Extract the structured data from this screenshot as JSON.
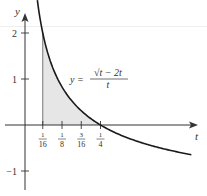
{
  "chart_data": {
    "type": "line",
    "title": "",
    "xlabel": "t",
    "ylabel": "y",
    "equation": {
      "lhs": "y =",
      "numerator": "√t − 2t",
      "denominator": "t"
    },
    "x_ticks": [
      {
        "value": 0.0625,
        "num": "1",
        "den": "16"
      },
      {
        "value": 0.125,
        "num": "1",
        "den": "8"
      },
      {
        "value": 0.1875,
        "num": "3",
        "den": "16"
      },
      {
        "value": 0.25,
        "num": "1",
        "den": "4"
      }
    ],
    "y_ticks": [
      {
        "value": 2,
        "label": "2"
      },
      {
        "value": 1,
        "label": "1"
      },
      {
        "value": -1,
        "label": "−1"
      }
    ],
    "xlim": [
      -0.06,
      0.56
    ],
    "ylim": [
      -1.4,
      2.5
    ],
    "grid": false,
    "shaded_region": {
      "from": 0.0625,
      "to": 0.25,
      "color": "#e6e6e6"
    },
    "series": [
      {
        "name": "y = (√t − 2t)/t",
        "color": "#1a1a1a",
        "x": [
          0.045,
          0.0625,
          0.08,
          0.1,
          0.125,
          0.15,
          0.1875,
          0.22,
          0.25,
          0.3,
          0.35,
          0.4,
          0.45,
          0.5,
          0.545
        ],
        "y": [
          2.71,
          2.0,
          1.54,
          1.16,
          0.83,
          0.58,
          0.31,
          0.13,
          0.0,
          -0.17,
          -0.31,
          -0.42,
          -0.51,
          -0.59,
          -0.65
        ]
      }
    ]
  },
  "axes": {
    "x_label": "t",
    "y_label": "y"
  }
}
